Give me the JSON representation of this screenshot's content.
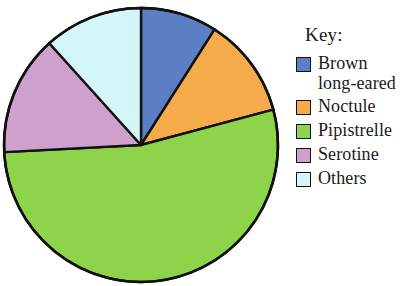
{
  "figure": {
    "kind": "pie-chart-with-key"
  },
  "legend": {
    "title": "Key:",
    "items": [
      {
        "label": "Brown\nlong-eared",
        "color": "#5b7ec4",
        "swatch_name": "legend-swatch-brown-long-eared"
      },
      {
        "label": "Noctule",
        "color": "#f5ab4a",
        "swatch_name": "legend-swatch-noctule"
      },
      {
        "label": "Pipistrelle",
        "color": "#8ed44a",
        "swatch_name": "legend-swatch-pipistrelle"
      },
      {
        "label": "Serotine",
        "color": "#cfa0cc",
        "swatch_name": "legend-swatch-serotine"
      },
      {
        "label": "Others",
        "color": "#d3f6f8",
        "swatch_name": "legend-swatch-others"
      }
    ]
  },
  "chart_data": {
    "type": "pie",
    "title": "",
    "legend_title": "Key:",
    "legend_position": "right",
    "start_angle_deg": 0,
    "direction": "clockwise",
    "center": {
      "x": 141,
      "y": 145
    },
    "radius": 137,
    "outline_color": "#111111",
    "labels": [
      "Brown long-eared",
      "Noctule",
      "Pipistrelle",
      "Serotine",
      "Others"
    ],
    "colors": [
      "#5b7ec4",
      "#f5ab4a",
      "#8ed44a",
      "#cfa0cc",
      "#d3f6f8"
    ],
    "values": [
      9,
      12,
      53.5,
      14,
      11.5
    ],
    "units": "percent",
    "slice_angles_deg": [
      {
        "label": "Brown long-eared",
        "start": 0,
        "end": 32.5,
        "sweep": 32.5
      },
      {
        "label": "Noctule",
        "start": 32.5,
        "end": 75,
        "sweep": 42.5
      },
      {
        "label": "Pipistrelle",
        "start": 75,
        "end": 267,
        "sweep": 192
      },
      {
        "label": "Serotine",
        "start": 267,
        "end": 318,
        "sweep": 51
      },
      {
        "label": "Others",
        "start": 318,
        "end": 360,
        "sweep": 42
      }
    ]
  }
}
